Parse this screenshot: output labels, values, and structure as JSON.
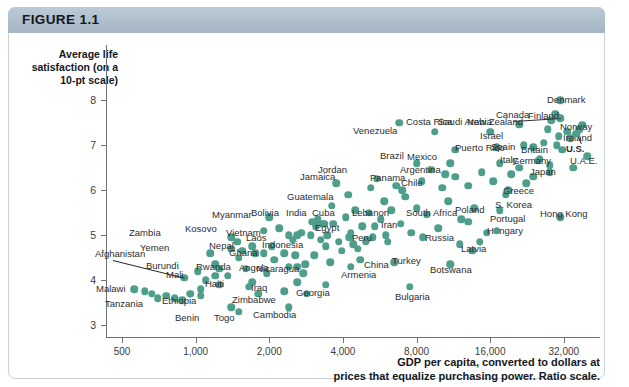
{
  "figure": {
    "label": "FIGURE 1.1",
    "header_color": "#aebecb",
    "dot_color": "#4f9e8b"
  },
  "chart_data": {
    "type": "scatter",
    "title": "FIGURE 1.1",
    "ylabel": "Average life satisfaction (on a 10-pt scale)",
    "xlabel": "GDP per capita, converted to dollars at prices that equalize purchasing power. Ratio scale.",
    "xlabel_line1": "GDP per capita, converted to dollars at",
    "xlabel_line2": "prices that equalize purchasing power. Ratio scale.",
    "xscale": "log",
    "yscale": "linear",
    "xlim": [
      430,
      45000
    ],
    "ylim": [
      2.6,
      8.6
    ],
    "grid": false,
    "legend": "none",
    "xticks": [
      500,
      1000,
      2000,
      4000,
      8000,
      16000,
      32000
    ],
    "xtick_labels": [
      "500",
      "1,000",
      "2,000",
      "4,000",
      "8,000",
      "16,000",
      "32,000"
    ],
    "yticks": [
      3,
      4,
      5,
      6,
      7,
      8
    ],
    "ytick_labels": [
      "3",
      "4",
      "5",
      "6",
      "7",
      "8"
    ],
    "points": [
      {
        "name": "Afghanistan",
        "x": 900,
        "y": 4.05,
        "lx": 95,
        "ly": 249,
        "leader": true,
        "bold": false
      },
      {
        "name": "Malawi",
        "x": 620,
        "y": 3.75,
        "lx": 96,
        "ly": 284,
        "leader": false,
        "bold": false
      },
      {
        "name": "Tanzania",
        "x": 700,
        "y": 3.6,
        "lx": 105,
        "ly": 299,
        "leader": false,
        "bold": false
      },
      {
        "name": "Burundi",
        "x": 1020,
        "y": 4.2,
        "lx": 146,
        "ly": 261,
        "leader": false,
        "bold": false
      },
      {
        "name": "Yemen",
        "x": 1500,
        "y": 4.5,
        "lx": 140,
        "ly": 243,
        "leader": false,
        "bold": false
      },
      {
        "name": "Zambia",
        "x": 1400,
        "y": 4.95,
        "lx": 129,
        "ly": 228,
        "leader": false,
        "bold": false
      },
      {
        "name": "Ethiopia",
        "x": 1050,
        "y": 3.65,
        "lx": 162,
        "ly": 296,
        "leader": false,
        "bold": false
      },
      {
        "name": "Mali",
        "x": 1200,
        "y": 4.1,
        "lx": 166,
        "ly": 270,
        "leader": false,
        "bold": false
      },
      {
        "name": "Benin",
        "x": 1400,
        "y": 3.4,
        "lx": 175,
        "ly": 313,
        "leader": false,
        "bold": false
      },
      {
        "name": "Togo",
        "x": 1500,
        "y": 3.3,
        "lx": 214,
        "ly": 313,
        "leader": false,
        "bold": false
      },
      {
        "name": "Rwanda",
        "x": 1250,
        "y": 4.25,
        "lx": 196,
        "ly": 262,
        "leader": false,
        "bold": false
      },
      {
        "name": "Zimbabwe",
        "x": 1800,
        "y": 3.7,
        "lx": 232,
        "ly": 295,
        "leader": false,
        "bold": false
      },
      {
        "name": "Haiti",
        "x": 1700,
        "y": 3.95,
        "lx": 205,
        "ly": 279,
        "leader": false,
        "bold": false
      },
      {
        "name": "Nepal",
        "x": 1700,
        "y": 4.75,
        "lx": 209,
        "ly": 241,
        "leader": false,
        "bold": false
      },
      {
        "name": "Kosovo",
        "x": 1900,
        "y": 5.1,
        "lx": 185,
        "ly": 224,
        "leader": false,
        "bold": false
      },
      {
        "name": "Myanmar",
        "x": 2000,
        "y": 5.4,
        "lx": 212,
        "ly": 210,
        "leader": false,
        "bold": false
      },
      {
        "name": "Ghana",
        "x": 2300,
        "y": 4.6,
        "lx": 229,
        "ly": 248,
        "leader": false,
        "bold": false
      },
      {
        "name": "Laos",
        "x": 2400,
        "y": 5.0,
        "lx": 246,
        "ly": 233,
        "leader": false,
        "bold": false
      },
      {
        "name": "Angola",
        "x": 2600,
        "y": 4.3,
        "lx": 239,
        "ly": 263,
        "leader": false,
        "bold": false
      },
      {
        "name": "Cambodia",
        "x": 2400,
        "y": 3.4,
        "lx": 253,
        "ly": 310,
        "leader": false,
        "bold": false
      },
      {
        "name": "Iraq",
        "x": 2600,
        "y": 3.95,
        "lx": 251,
        "ly": 283,
        "leader": false,
        "bold": false
      },
      {
        "name": "Nicaragua",
        "x": 2800,
        "y": 4.35,
        "lx": 256,
        "ly": 264,
        "leader": false,
        "bold": false
      },
      {
        "name": "Georgia",
        "x": 3400,
        "y": 3.9,
        "lx": 296,
        "ly": 288,
        "leader": false,
        "bold": false
      },
      {
        "name": "Vietnam",
        "x": 2600,
        "y": 5.0,
        "lx": 226,
        "ly": 228,
        "leader": false,
        "bold": false
      },
      {
        "name": "Bolivia",
        "x": 3000,
        "y": 5.3,
        "lx": 251,
        "ly": 208,
        "leader": false,
        "bold": false
      },
      {
        "name": "India",
        "x": 3100,
        "y": 5.2,
        "lx": 286,
        "ly": 208,
        "leader": false,
        "bold": false
      },
      {
        "name": "Cuba",
        "x": 3300,
        "y": 5.25,
        "lx": 312,
        "ly": 208,
        "leader": false,
        "bold": false
      },
      {
        "name": "Indonesia",
        "x": 3400,
        "y": 4.75,
        "lx": 262,
        "ly": 240,
        "leader": false,
        "bold": false
      },
      {
        "name": "Guatemala",
        "x": 3600,
        "y": 5.65,
        "lx": 287,
        "ly": 192,
        "leader": false,
        "bold": false
      },
      {
        "name": "Jamaica",
        "x": 4200,
        "y": 5.9,
        "lx": 300,
        "ly": 172,
        "leader": false,
        "bold": false
      },
      {
        "name": "Egypt",
        "x": 4300,
        "y": 5.05,
        "lx": 315,
        "ly": 223,
        "leader": false,
        "bold": false
      },
      {
        "name": "Armenia",
        "x": 4300,
        "y": 4.3,
        "lx": 341,
        "ly": 270,
        "leader": false,
        "bold": false
      },
      {
        "name": "China",
        "x": 4700,
        "y": 4.45,
        "lx": 364,
        "ly": 260,
        "leader": false,
        "bold": false
      },
      {
        "name": "Peru",
        "x": 5000,
        "y": 4.9,
        "lx": 352,
        "ly": 233,
        "leader": false,
        "bold": false
      },
      {
        "name": "Jordan",
        "x": 5200,
        "y": 6.05,
        "lx": 318,
        "ly": 165,
        "leader": false,
        "bold": false
      },
      {
        "name": "Lebanon",
        "x": 5400,
        "y": 5.2,
        "lx": 352,
        "ly": 208,
        "leader": false,
        "bold": false
      },
      {
        "name": "Iran",
        "x": 6000,
        "y": 5.0,
        "lx": 381,
        "ly": 220,
        "leader": false,
        "bold": false
      },
      {
        "name": "Turkey",
        "x": 6500,
        "y": 4.4,
        "lx": 392,
        "ly": 256,
        "leader": false,
        "bold": false
      },
      {
        "name": "Bulgaria",
        "x": 7500,
        "y": 3.85,
        "lx": 395,
        "ly": 292,
        "leader": false,
        "bold": false
      },
      {
        "name": "Panama",
        "x": 7000,
        "y": 6.0,
        "lx": 370,
        "ly": 173,
        "leader": false,
        "bold": false
      },
      {
        "name": "Venezuela",
        "x": 6800,
        "y": 7.5,
        "lx": 353,
        "ly": 126,
        "leader": false,
        "bold": false
      },
      {
        "name": "Brazil",
        "x": 8000,
        "y": 6.6,
        "lx": 380,
        "ly": 151,
        "leader": false,
        "bold": false
      },
      {
        "name": "South Africa",
        "x": 8500,
        "y": 4.95,
        "lx": 406,
        "ly": 208,
        "leader": false,
        "bold": false
      },
      {
        "name": "Russia",
        "x": 12000,
        "y": 4.8,
        "lx": 425,
        "ly": 233,
        "leader": false,
        "bold": false
      },
      {
        "name": "Botswana",
        "x": 11000,
        "y": 4.35,
        "lx": 430,
        "ly": 265,
        "leader": false,
        "bold": false
      },
      {
        "name": "Latvia",
        "x": 13500,
        "y": 4.65,
        "lx": 461,
        "ly": 244,
        "leader": false,
        "bold": false
      },
      {
        "name": "Hungary",
        "x": 14500,
        "y": 4.85,
        "lx": 487,
        "ly": 226,
        "leader": false,
        "bold": false
      },
      {
        "name": "Poland",
        "x": 13000,
        "y": 5.3,
        "lx": 455,
        "ly": 205,
        "leader": false,
        "bold": false
      },
      {
        "name": "Portugal",
        "x": 17000,
        "y": 5.1,
        "lx": 490,
        "ly": 214,
        "leader": false,
        "bold": false
      },
      {
        "name": "S. Korea",
        "x": 17500,
        "y": 5.55,
        "lx": 495,
        "ly": 200,
        "leader": false,
        "bold": false
      },
      {
        "name": "Greece",
        "x": 19000,
        "y": 6.0,
        "lx": 503,
        "ly": 186,
        "leader": false,
        "bold": false
      },
      {
        "name": "Hong Kong",
        "x": 31000,
        "y": 5.4,
        "lx": 540,
        "ly": 209,
        "leader": false,
        "bold": false
      },
      {
        "name": "Chile",
        "x": 10500,
        "y": 6.35,
        "lx": 401,
        "ly": 178,
        "leader": false,
        "bold": false
      },
      {
        "name": "Argentina",
        "x": 11000,
        "y": 6.6,
        "lx": 400,
        "ly": 165,
        "leader": false,
        "bold": false
      },
      {
        "name": "Mexico",
        "x": 11500,
        "y": 6.9,
        "lx": 407,
        "ly": 152,
        "leader": false,
        "bold": false
      },
      {
        "name": "Costa Rica",
        "x": 9500,
        "y": 7.3,
        "lx": 406,
        "ly": 117,
        "leader": false,
        "bold": false
      },
      {
        "name": "Saudi Arabia",
        "x": 16000,
        "y": 7.3,
        "lx": 438,
        "ly": 117,
        "leader": false,
        "bold": false
      },
      {
        "name": "New Zealand",
        "x": 21000,
        "y": 7.45,
        "lx": 467,
        "ly": 117,
        "leader": false,
        "bold": false
      },
      {
        "name": "Puerto Rico",
        "x": 17000,
        "y": 6.95,
        "lx": 455,
        "ly": 143,
        "leader": false,
        "bold": false
      },
      {
        "name": "Israel",
        "x": 22000,
        "y": 7.0,
        "lx": 480,
        "ly": 131,
        "leader": false,
        "bold": false
      },
      {
        "name": "Spain",
        "x": 24000,
        "y": 6.95,
        "lx": 491,
        "ly": 142,
        "leader": false,
        "bold": false
      },
      {
        "name": "Italy",
        "x": 25000,
        "y": 6.65,
        "lx": 500,
        "ly": 155,
        "leader": false,
        "bold": false
      },
      {
        "name": "Germany",
        "x": 28000,
        "y": 6.55,
        "lx": 512,
        "ly": 156,
        "leader": false,
        "bold": false
      },
      {
        "name": "Japan",
        "x": 28000,
        "y": 6.4,
        "lx": 530,
        "ly": 167,
        "leader": false,
        "bold": false
      },
      {
        "name": "Britain",
        "x": 30000,
        "y": 7.0,
        "lx": 521,
        "ly": 145,
        "leader": false,
        "bold": false
      },
      {
        "name": "Canada",
        "x": 31000,
        "y": 7.6,
        "lx": 496,
        "ly": 110,
        "leader": true,
        "bold": false
      },
      {
        "name": "Finland",
        "x": 30000,
        "y": 7.65,
        "lx": 528,
        "ly": 111,
        "leader": false,
        "bold": false
      },
      {
        "name": "Denmark",
        "x": 31000,
        "y": 8.0,
        "lx": 547,
        "ly": 95,
        "leader": false,
        "bold": false
      },
      {
        "name": "Norway",
        "x": 38000,
        "y": 7.45,
        "lx": 560,
        "ly": 122,
        "leader": false,
        "bold": false
      },
      {
        "name": "Ireland",
        "x": 36000,
        "y": 7.25,
        "lx": 563,
        "ly": 133,
        "leader": true,
        "bold": false
      },
      {
        "name": "U.S.",
        "x": 36000,
        "y": 7.25,
        "lx": 566,
        "ly": 144,
        "leader": false,
        "bold": true
      },
      {
        "name": "U.A.E.",
        "x": 40000,
        "y": 6.75,
        "lx": 570,
        "ly": 156,
        "leader": false,
        "bold": false
      }
    ],
    "unlabeled_points": [
      [
        560,
        3.8
      ],
      [
        660,
        3.7
      ],
      [
        760,
        3.65
      ],
      [
        820,
        3.6
      ],
      [
        880,
        3.55
      ],
      [
        950,
        3.7
      ],
      [
        1050,
        3.8
      ],
      [
        1100,
        4.0
      ],
      [
        1150,
        4.6
      ],
      [
        1200,
        4.35
      ],
      [
        1250,
        3.9
      ],
      [
        1350,
        4.1
      ],
      [
        1400,
        4.7
      ],
      [
        1480,
        4.85
      ],
      [
        1550,
        4.65
      ],
      [
        1600,
        4.25
      ],
      [
        1650,
        3.85
      ],
      [
        1750,
        4.6
      ],
      [
        1900,
        4.6
      ],
      [
        1950,
        4.15
      ],
      [
        2050,
        4.75
      ],
      [
        2100,
        4.45
      ],
      [
        2200,
        5.15
      ],
      [
        2300,
        3.75
      ],
      [
        2400,
        4.3
      ],
      [
        2500,
        4.9
      ],
      [
        2550,
        4.55
      ],
      [
        2700,
        5.05
      ],
      [
        2750,
        4.15
      ],
      [
        2850,
        3.7
      ],
      [
        2950,
        5.0
      ],
      [
        3050,
        4.55
      ],
      [
        3150,
        5.35
      ],
      [
        3250,
        4.9
      ],
      [
        3350,
        5.25
      ],
      [
        3450,
        5.0
      ],
      [
        3550,
        4.4
      ],
      [
        3650,
        5.25
      ],
      [
        3750,
        6.15
      ],
      [
        3850,
        4.85
      ],
      [
        3950,
        4.65
      ],
      [
        4100,
        5.4
      ],
      [
        4250,
        4.95
      ],
      [
        4400,
        4.8
      ],
      [
        4500,
        5.55
      ],
      [
        4600,
        4.7
      ],
      [
        4800,
        5.2
      ],
      [
        4950,
        4.85
      ],
      [
        5100,
        5.5
      ],
      [
        5300,
        4.95
      ],
      [
        5500,
        6.25
      ],
      [
        5700,
        5.35
      ],
      [
        5900,
        5.75
      ],
      [
        6100,
        4.85
      ],
      [
        6300,
        5.55
      ],
      [
        6600,
        6.1
      ],
      [
        6900,
        5.25
      ],
      [
        7200,
        5.85
      ],
      [
        7600,
        5.05
      ],
      [
        8000,
        5.6
      ],
      [
        8400,
        6.2
      ],
      [
        8800,
        5.45
      ],
      [
        9200,
        6.45
      ],
      [
        9800,
        5.15
      ],
      [
        10200,
        6.05
      ],
      [
        10800,
        5.75
      ],
      [
        11500,
        6.3
      ],
      [
        12200,
        5.35
      ],
      [
        13000,
        6.1
      ],
      [
        13800,
        5.6
      ],
      [
        14800,
        6.4
      ],
      [
        15500,
        5.05
      ],
      [
        16500,
        6.2
      ],
      [
        17500,
        6.6
      ],
      [
        18500,
        5.9
      ],
      [
        19500,
        6.35
      ],
      [
        21000,
        6.5
      ],
      [
        22500,
        6.15
      ],
      [
        24000,
        6.3
      ],
      [
        25500,
        6.7
      ],
      [
        26500,
        7.05
      ],
      [
        27500,
        7.35
      ],
      [
        28500,
        7.55
      ],
      [
        29500,
        7.7
      ],
      [
        30500,
        7.2
      ],
      [
        31500,
        6.9
      ],
      [
        33000,
        7.3
      ],
      [
        34000,
        7.15
      ],
      [
        35000,
        6.5
      ],
      [
        37000,
        7.35
      ]
    ]
  }
}
